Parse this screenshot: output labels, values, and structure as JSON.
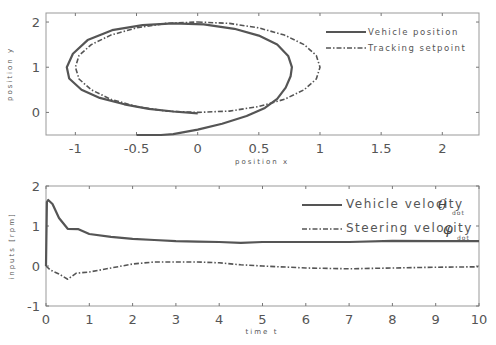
{
  "chart_data": [
    {
      "type": "line",
      "title": "",
      "xlabel": "position x",
      "ylabel": "position y",
      "xlim": [
        -1.24,
        2.3
      ],
      "ylim": [
        -0.5,
        2.2
      ],
      "xticks": [
        "-1",
        "-0.5",
        "0",
        "0.5",
        "1",
        "1.5",
        "2"
      ],
      "yticks": [
        "0",
        "1",
        "2"
      ],
      "grid": false,
      "legend_position": "upper right",
      "series": [
        {
          "name": "Vehicle position",
          "style": "solid",
          "x": [
            -0.5,
            -0.3,
            -0.2,
            0.0,
            0.2,
            0.4,
            0.55,
            0.65,
            0.72,
            0.76,
            0.77,
            0.74,
            0.65,
            0.5,
            0.3,
            0.05,
            -0.2,
            -0.45,
            -0.7,
            -0.9,
            -1.02,
            -1.07,
            -1.05,
            -0.95,
            -0.8,
            -0.6,
            -0.4,
            -0.2,
            0.0
          ],
          "y": [
            -0.5,
            -0.5,
            -0.48,
            -0.38,
            -0.25,
            -0.08,
            0.1,
            0.3,
            0.55,
            0.8,
            1.0,
            1.25,
            1.5,
            1.7,
            1.85,
            1.95,
            1.97,
            1.93,
            1.82,
            1.6,
            1.3,
            1.0,
            0.75,
            0.5,
            0.32,
            0.18,
            0.08,
            0.02,
            -0.02
          ]
        },
        {
          "name": "Tracking setpoint",
          "style": "dashdot",
          "x": [
            0.0,
            0.26,
            0.5,
            0.71,
            0.87,
            0.97,
            1.0,
            0.97,
            0.87,
            0.71,
            0.5,
            0.26,
            0.0,
            -0.26,
            -0.5,
            -0.71,
            -0.87,
            -0.97,
            -1.0,
            -0.97,
            -0.87,
            -0.71,
            -0.5,
            -0.26,
            0.0
          ],
          "y": [
            2.0,
            1.97,
            1.87,
            1.71,
            1.5,
            1.26,
            1.0,
            0.74,
            0.5,
            0.29,
            0.13,
            0.03,
            0.0,
            0.03,
            0.13,
            0.29,
            0.5,
            0.74,
            1.0,
            1.26,
            1.5,
            1.71,
            1.87,
            1.97,
            2.0
          ]
        }
      ]
    },
    {
      "type": "line",
      "title": "",
      "xlabel": "time t",
      "ylabel": "inputs [rpm]",
      "xlim": [
        0,
        10
      ],
      "ylim": [
        -1,
        2
      ],
      "xticks": [
        "0",
        "1",
        "2",
        "3",
        "4",
        "5",
        "6",
        "7",
        "8",
        "9",
        "10"
      ],
      "yticks": [
        "-1",
        "0",
        "1",
        "2"
      ],
      "grid": false,
      "legend_position": "upper right",
      "series": [
        {
          "name": "Vehicle velocity θdot",
          "style": "solid",
          "x": [
            0,
            0.02,
            0.05,
            0.15,
            0.3,
            0.5,
            0.75,
            1.0,
            1.5,
            2.0,
            2.5,
            3.0,
            3.5,
            4.0,
            4.5,
            5.0,
            6.0,
            7.0,
            8.0,
            9.0,
            10.0
          ],
          "y": [
            0,
            1.6,
            1.65,
            1.55,
            1.2,
            0.93,
            0.92,
            0.8,
            0.73,
            0.68,
            0.65,
            0.62,
            0.61,
            0.6,
            0.58,
            0.6,
            0.6,
            0.6,
            0.63,
            0.62,
            0.62
          ]
        },
        {
          "name": "Steering velocity φdot",
          "style": "dashdot",
          "x": [
            0,
            0.1,
            0.3,
            0.5,
            0.7,
            1.0,
            1.5,
            2.0,
            2.5,
            3.0,
            3.5,
            4.0,
            4.5,
            5.0,
            6.0,
            7.0,
            8.0,
            9.0,
            10.0
          ],
          "y": [
            0,
            -0.1,
            -0.2,
            -0.33,
            -0.18,
            -0.15,
            -0.05,
            0.05,
            0.1,
            0.1,
            0.1,
            0.08,
            0.03,
            0.0,
            -0.05,
            -0.07,
            -0.05,
            -0.03,
            -0.02
          ]
        }
      ]
    }
  ],
  "plot1": {
    "xlabel": "position x",
    "ylabel": "position y",
    "legend": {
      "line1": "Vehicle position",
      "line2": "Tracking setpoint"
    }
  },
  "plot2": {
    "xlabel": "time t",
    "ylabel": "inputs [rpm]",
    "legend": {
      "line1": "Vehicle velocity",
      "line1_sym": "θ",
      "line1_sub": "dot",
      "line2": "Steering velocity",
      "line2_sym": "φ",
      "line2_sub": "dot"
    }
  },
  "colors": {
    "line": "#555555",
    "axis": "#888888",
    "text": "#555555"
  }
}
